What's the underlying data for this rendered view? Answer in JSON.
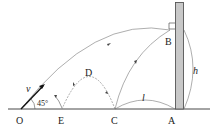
{
  "diagram": {
    "points": {
      "O": "O",
      "E": "E",
      "C": "C",
      "A": "A",
      "B": "B",
      "D": "D"
    },
    "labels": {
      "velocity": "v",
      "angle": "45°",
      "distance": "l",
      "height": "h"
    },
    "colors": {
      "wall_fill": "#c8c8c8",
      "wall_stroke": "#555555",
      "line": "#555555",
      "ground": "#333333"
    }
  }
}
